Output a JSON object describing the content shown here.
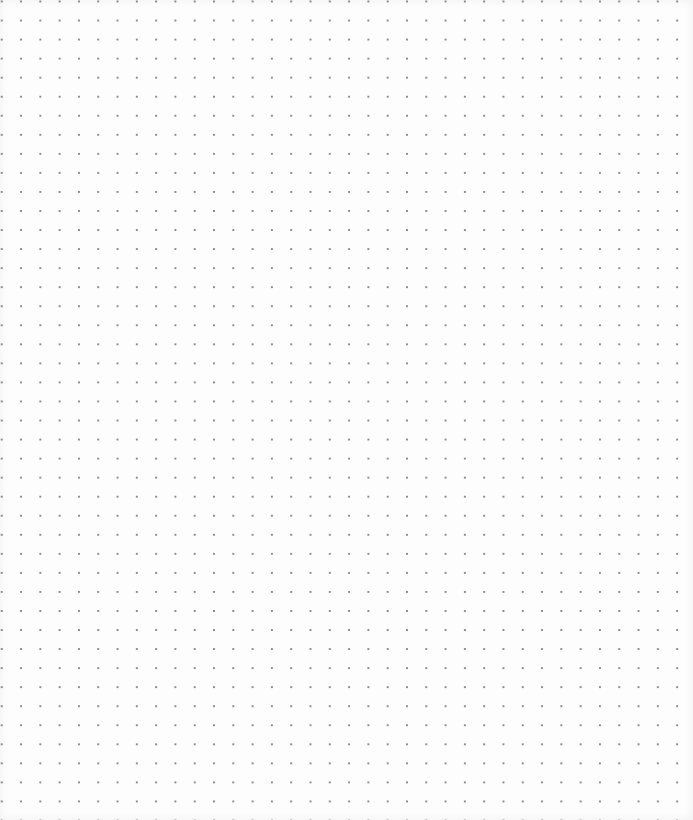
{
  "canvas": {
    "type": "dot-grid",
    "background_color": "#fdfdfd",
    "dot_color": "#8a8a8a",
    "dot_spacing_px": 19,
    "columns": 35,
    "rows": 42
  }
}
